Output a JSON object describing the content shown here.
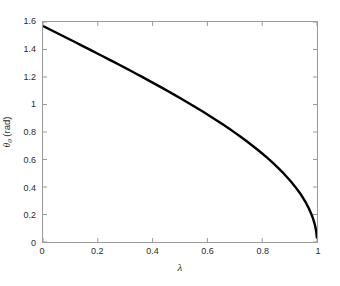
{
  "figure": {
    "background_color": "#ffffff",
    "axis_color": "#9a9a9a",
    "text_color": "#2b2b2b"
  },
  "axis_labels": {
    "x": "λ",
    "y_symbol": "θ",
    "y_subscript": "0",
    "y_units": " (rad)"
  },
  "chart_data": {
    "type": "line",
    "title": "",
    "xlabel": "λ",
    "ylabel": "θ₀ (rad)",
    "xlim": [
      0,
      1
    ],
    "ylim": [
      0,
      1.6
    ],
    "xticks": [
      0,
      0.2,
      0.4,
      0.6,
      0.8,
      1
    ],
    "xticklabels": [
      "0",
      "0.2",
      "0.4",
      "0.6",
      "0.8",
      "1"
    ],
    "yticks": [
      0,
      0.2,
      0.4,
      0.6,
      0.8,
      1,
      1.2,
      1.4,
      1.6
    ],
    "yticklabels": [
      "0",
      "0.2",
      "0.4",
      "0.6",
      "0.8",
      "1",
      "1.2",
      "1.4",
      "1.6"
    ],
    "grid": false,
    "legend": null,
    "legend_position": "none",
    "series": [
      {
        "name": "theta_0 = arccos(lambda)",
        "color": "#000000",
        "linewidth": 2.4,
        "x": [
          0.0,
          0.02,
          0.04,
          0.06,
          0.08,
          0.1,
          0.12,
          0.14,
          0.16,
          0.18,
          0.2,
          0.22,
          0.24,
          0.26,
          0.28,
          0.3,
          0.32,
          0.34,
          0.36,
          0.38,
          0.4,
          0.42,
          0.44,
          0.46,
          0.48,
          0.5,
          0.52,
          0.54,
          0.56,
          0.58,
          0.6,
          0.62,
          0.64,
          0.66,
          0.68,
          0.7,
          0.72,
          0.74,
          0.76,
          0.78,
          0.8,
          0.82,
          0.84,
          0.86,
          0.88,
          0.9,
          0.91,
          0.92,
          0.93,
          0.94,
          0.95,
          0.96,
          0.97,
          0.98,
          0.985,
          0.99,
          0.993,
          0.996,
          0.998,
          0.9995
        ],
        "y": [
          1.5708,
          1.5508,
          1.5308,
          1.5108,
          1.4907,
          1.4706,
          1.4505,
          1.4303,
          1.4101,
          1.3898,
          1.3694,
          1.349,
          1.3284,
          1.3078,
          1.287,
          1.2661,
          1.2451,
          1.2239,
          1.2025,
          1.181,
          1.1593,
          1.1374,
          1.1152,
          1.0928,
          1.0701,
          1.0472,
          1.0239,
          1.0003,
          0.9764,
          0.9521,
          0.9273,
          0.9021,
          0.8763,
          0.85,
          0.823,
          0.7954,
          0.767,
          0.7377,
          0.7075,
          0.6761,
          0.6435,
          0.6094,
          0.5735,
          0.5355,
          0.4949,
          0.451,
          0.4273,
          0.4027,
          0.3767,
          0.3492,
          0.3176,
          0.2838,
          0.2456,
          0.1997,
          0.1733,
          0.1416,
          0.1183,
          0.0894,
          0.0633,
          0.0316
        ]
      }
    ]
  }
}
